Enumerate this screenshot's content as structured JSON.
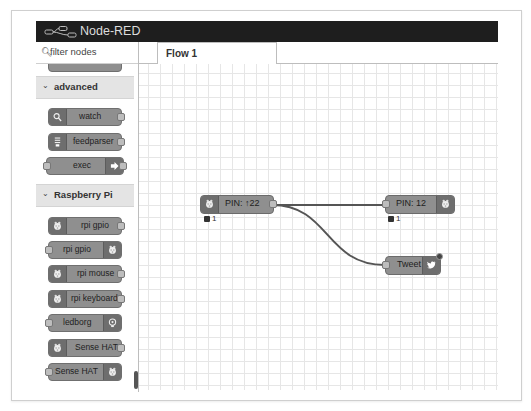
{
  "app": {
    "title": "Node-RED"
  },
  "palette": {
    "filter_placeholder": "filter nodes",
    "categories": [
      {
        "label": "advanced",
        "expanded": true,
        "nodes": [
          {
            "label": "watch",
            "icon": "search-icon"
          },
          {
            "label": "feedparser",
            "icon": "feed-icon"
          },
          {
            "label": "exec",
            "icon": "arrow-icon"
          }
        ]
      },
      {
        "label": "Raspberry Pi",
        "expanded": true,
        "nodes": [
          {
            "label": "rpi gpio",
            "icon": "raspberry-icon",
            "type": "input"
          },
          {
            "label": "rpi gpio",
            "icon": "raspberry-icon",
            "type": "output"
          },
          {
            "label": "rpi mouse",
            "icon": "raspberry-icon",
            "type": "input"
          },
          {
            "label": "rpi keyboard",
            "icon": "raspberry-icon",
            "type": "input"
          },
          {
            "label": "ledborg",
            "icon": "bulb-icon",
            "type": "output"
          },
          {
            "label": "Sense HAT",
            "icon": "raspberry-icon",
            "type": "input"
          },
          {
            "label": "Sense HAT",
            "icon": "raspberry-icon",
            "type": "output"
          }
        ]
      }
    ]
  },
  "workspace": {
    "tabs": [
      {
        "label": "Flow 1",
        "active": true
      }
    ],
    "nodes": [
      {
        "id": "pin22",
        "label": "PIN: ↑22",
        "icon": "raspberry-icon",
        "status": "1"
      },
      {
        "id": "pin12",
        "label": "PIN: 12",
        "icon": "raspberry-icon",
        "status": "1"
      },
      {
        "id": "tweet",
        "label": "Tweet",
        "icon": "twitter-icon"
      }
    ],
    "wires": [
      {
        "from": "pin22",
        "to": "pin12"
      },
      {
        "from": "pin22",
        "to": "tweet"
      }
    ]
  }
}
